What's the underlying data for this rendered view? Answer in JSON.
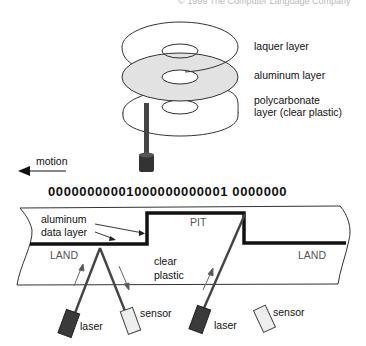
{
  "caption": "© 1999 The Computer Language Company",
  "disc": {
    "layers": [
      {
        "label": "laquer layer",
        "fill": "#ffffff"
      },
      {
        "label": "aluminum layer",
        "fill": "#e2e2e2"
      },
      {
        "label": "polycarbonate",
        "label2": "layer (clear plastic)",
        "fill": "#ffffff"
      }
    ]
  },
  "motion": {
    "label": "motion",
    "direction": "left"
  },
  "bitstream": {
    "part1": "00000000001000000000001",
    "part2": "0000000"
  },
  "cross_section": {
    "aluminum_label_line1": "aluminum",
    "aluminum_label_line2": "data layer",
    "pit_label": "PIT",
    "land_left_label": "LAND",
    "land_right_label": "LAND",
    "clear_label_line1": "clear",
    "clear_label_line2": "plastic",
    "left_pair": {
      "laser_label": "laser",
      "sensor_label": "sensor"
    },
    "right_pair": {
      "laser_label": "laser",
      "sensor_label": "sensor"
    }
  },
  "colors": {
    "line": "#222222",
    "laser_body": "#3a3a3a",
    "sensor_body": "#eeeeee",
    "beam": "#555555",
    "aluminum_fill": "#e2e2e2"
  }
}
